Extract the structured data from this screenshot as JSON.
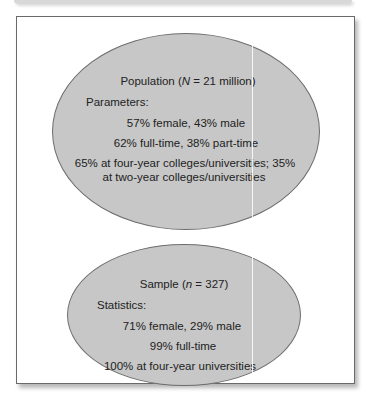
{
  "population": {
    "title_prefix": "Population (",
    "title_var": "N",
    "title_suffix": " = 21 million)",
    "section_label": "Parameters:",
    "items": [
      "57% female, 43% male",
      "62% full-time, 38% part-time",
      "65% at four-year colleges/universities; 35%",
      "at two-year colleges/universities"
    ]
  },
  "sample": {
    "title_prefix": "Sample (",
    "title_var": "n",
    "title_suffix": " = 327)",
    "section_label": "Statistics:",
    "items": [
      "71% female, 29% male",
      "99% full-time",
      "100% at four-year universities"
    ]
  },
  "colors": {
    "ellipse_fill": "#c7c7c7",
    "ellipse_border": "#6d6d6d",
    "frame_border": "#6a6a6a",
    "text": "#222222"
  }
}
